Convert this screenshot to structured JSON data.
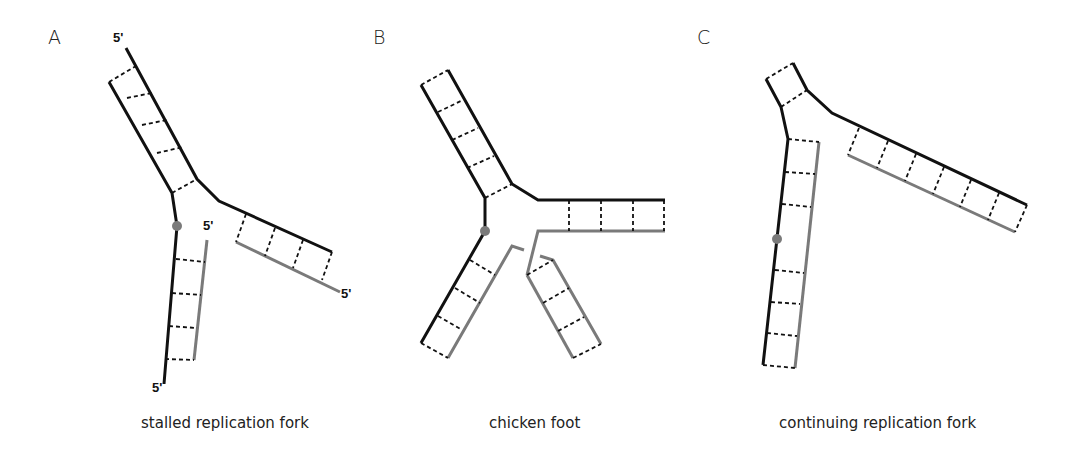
{
  "figure": {
    "panels": [
      {
        "letter": "A",
        "caption": "stalled replication fork",
        "end_labels": [
          "5'",
          "5'",
          "5'",
          "5'"
        ]
      },
      {
        "letter": "B",
        "caption": "chicken foot"
      },
      {
        "letter": "C",
        "caption": "continuing replication fork"
      }
    ]
  },
  "colors": {
    "parental_strand": "#111111",
    "nascent_strand": "#7a7a7a",
    "hydrogen_bonds": "#111111",
    "lesion_dot": "#7a7a7a",
    "background": "#ffffff"
  },
  "legend_semantics": {
    "black_line": "parental DNA strand",
    "grey_line": "newly synthesized strand",
    "dashed_line": "base pairing",
    "grey_dot": "lesion"
  }
}
